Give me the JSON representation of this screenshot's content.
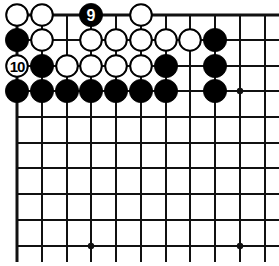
{
  "diagram": {
    "type": "go-board-fragment",
    "corner": "top-left",
    "grid": {
      "columns_x": [
        17,
        42,
        67,
        91,
        116,
        141,
        166,
        190,
        215,
        240,
        265
      ],
      "rows_y": [
        15,
        40,
        66,
        91,
        117,
        143,
        168,
        194,
        220,
        246
      ],
      "line_right_end": 279,
      "line_bottom_end": 262,
      "top_edge_row": 0,
      "left_edge_col": 0
    },
    "colors": {
      "black_stone": "#000000",
      "white_stone": "#ffffff",
      "line": "#111111",
      "background": "#ffffff"
    },
    "hoshi": [
      {
        "col": 9,
        "row": 3
      },
      {
        "col": 3,
        "row": 9
      },
      {
        "col": 9,
        "row": 9
      }
    ],
    "stones": [
      {
        "col": 0,
        "row": 0,
        "color": "white",
        "label": ""
      },
      {
        "col": 1,
        "row": 0,
        "color": "white",
        "label": ""
      },
      {
        "col": 3,
        "row": 0,
        "color": "black",
        "label": "9"
      },
      {
        "col": 5,
        "row": 0,
        "color": "white",
        "label": ""
      },
      {
        "col": 0,
        "row": 1,
        "color": "black",
        "label": ""
      },
      {
        "col": 1,
        "row": 1,
        "color": "white",
        "label": ""
      },
      {
        "col": 3,
        "row": 1,
        "color": "white",
        "label": ""
      },
      {
        "col": 4,
        "row": 1,
        "color": "white",
        "label": ""
      },
      {
        "col": 5,
        "row": 1,
        "color": "white",
        "label": ""
      },
      {
        "col": 6,
        "row": 1,
        "color": "white",
        "label": ""
      },
      {
        "col": 7,
        "row": 1,
        "color": "white",
        "label": ""
      },
      {
        "col": 8,
        "row": 1,
        "color": "black",
        "label": ""
      },
      {
        "col": 0,
        "row": 2,
        "color": "white",
        "label": "10"
      },
      {
        "col": 1,
        "row": 2,
        "color": "black",
        "label": ""
      },
      {
        "col": 2,
        "row": 2,
        "color": "white",
        "label": ""
      },
      {
        "col": 3,
        "row": 2,
        "color": "white",
        "label": ""
      },
      {
        "col": 4,
        "row": 2,
        "color": "white",
        "label": ""
      },
      {
        "col": 5,
        "row": 2,
        "color": "white",
        "label": ""
      },
      {
        "col": 6,
        "row": 2,
        "color": "black",
        "label": ""
      },
      {
        "col": 8,
        "row": 2,
        "color": "black",
        "label": ""
      },
      {
        "col": 0,
        "row": 3,
        "color": "black",
        "label": ""
      },
      {
        "col": 1,
        "row": 3,
        "color": "black",
        "label": ""
      },
      {
        "col": 2,
        "row": 3,
        "color": "black",
        "label": ""
      },
      {
        "col": 3,
        "row": 3,
        "color": "black",
        "label": ""
      },
      {
        "col": 4,
        "row": 3,
        "color": "black",
        "label": ""
      },
      {
        "col": 5,
        "row": 3,
        "color": "black",
        "label": ""
      },
      {
        "col": 6,
        "row": 3,
        "color": "black",
        "label": ""
      },
      {
        "col": 8,
        "row": 3,
        "color": "black",
        "label": ""
      }
    ],
    "move_labels": [
      "9",
      "10"
    ]
  }
}
